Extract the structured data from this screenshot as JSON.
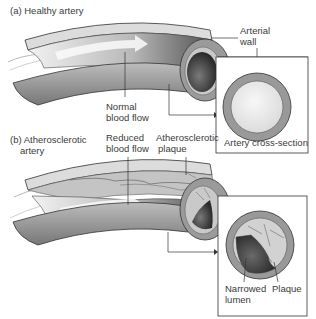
{
  "figure": {
    "panel_a": {
      "title": "(a) Healthy artery",
      "labels": {
        "arterial_wall_line1": "Arterial",
        "arterial_wall_line2": "wall",
        "normal_flow_line1": "Normal",
        "normal_flow_line2": "blood flow"
      },
      "inset_caption": "Artery cross-section"
    },
    "panel_b": {
      "title_line1": "(b) Atherosclerotic",
      "title_line2": "artery",
      "labels": {
        "reduced_flow_line1": "Reduced",
        "reduced_flow_line2": "blood flow",
        "plaque_line1": "Atherosclerotic",
        "plaque_line2": "plaque",
        "narrowed_lumen_line1": "Narrowed",
        "narrowed_lumen_line2": "lumen",
        "inset_plaque": "Plaque"
      }
    },
    "colors": {
      "wall": "#9a9a9a",
      "wall_light": "#cfcfcf",
      "lumen_dark": "#5a5a5a",
      "lumen_light": "#eeeeee",
      "line": "#333333"
    }
  }
}
